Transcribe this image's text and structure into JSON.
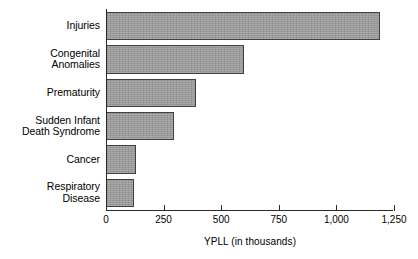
{
  "chart_data": {
    "type": "bar",
    "orientation": "horizontal",
    "title": "",
    "xlabel": "YPLL (in thousands)",
    "ylabel": "",
    "categories": [
      "Injuries",
      "Congenital Anomalies",
      "Prematurity",
      "Sudden Infant Death Syndrome",
      "Cancer",
      "Respiratory Disease"
    ],
    "category_lines": [
      [
        "Injuries"
      ],
      [
        "Congenital",
        "Anomalies"
      ],
      [
        "Prematurity"
      ],
      [
        "Sudden Infant",
        "Death Syndrome"
      ],
      [
        "Cancer"
      ],
      [
        "Respiratory",
        "Disease"
      ]
    ],
    "values": [
      1190,
      600,
      390,
      295,
      130,
      120
    ],
    "xlim": [
      0,
      1250
    ],
    "xticks": [
      0,
      250,
      500,
      750,
      1000,
      1250
    ],
    "xtick_labels": [
      "0",
      "250",
      "500",
      "750",
      "1,000",
      "1,250"
    ],
    "grid": false,
    "legend": false,
    "bar_fill_color": "#9b9b9b",
    "bar_border_color": "#404040",
    "axis_color": "#2b2b2b"
  }
}
